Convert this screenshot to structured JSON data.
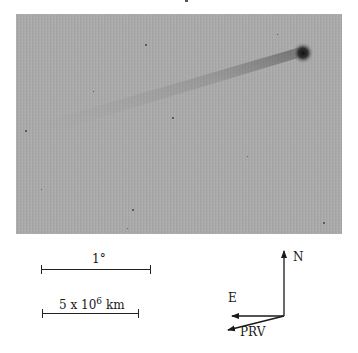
{
  "figure": {
    "image": {
      "subject": "comet with nucleus and faint tail",
      "background_color": "#a9a9a9",
      "nucleus_color": "#1e1e1e"
    },
    "scale_bars": [
      {
        "label": "1°"
      },
      {
        "label_base": "5 x 10",
        "label_exponent": "6",
        "label_unit": "km"
      }
    ],
    "compass": {
      "north_label": "N",
      "east_label": "E",
      "prv_label": "PRV"
    }
  }
}
